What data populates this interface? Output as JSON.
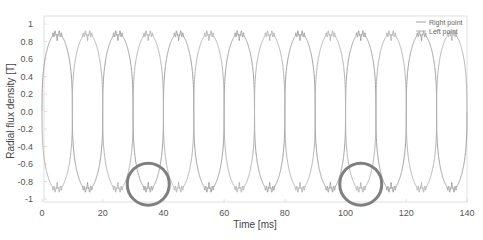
{
  "chart_data": {
    "type": "line",
    "title": "",
    "xlabel": "Time [ms]",
    "ylabel": "Radial flux density [T]",
    "xlim": [
      0,
      140
    ],
    "ylim": [
      -1.1,
      1.1
    ],
    "x_ticks": [
      0,
      20,
      40,
      60,
      80,
      100,
      120,
      140
    ],
    "x_tick_labels": [
      "0",
      "20",
      "40",
      "60",
      "80",
      "100",
      "120",
      "140"
    ],
    "y_ticks": [
      1,
      0.8,
      0.6,
      0.4,
      0.2,
      0,
      -0.2,
      -0.4,
      -0.6,
      -0.8,
      -1
    ],
    "y_tick_labels": [
      "1",
      "0.8",
      "0.6",
      "0.4",
      "0.2",
      "0.0",
      "-0.2",
      "-0.4",
      "-0.6",
      "-0.8",
      "-1"
    ],
    "grid": false,
    "legend_position": "upper right",
    "series": [
      {
        "name": "Right point",
        "color": "#a0a0a0",
        "period_ms": 20,
        "peak_value": 0.93,
        "peak_times_ms": [
          5,
          25,
          45,
          65,
          85,
          105,
          125
        ],
        "valley_value": -0.93,
        "valley_times_ms": [
          15,
          35,
          55,
          75,
          95,
          115,
          135
        ],
        "zero_crossings_ms": [
          0,
          10,
          20,
          30,
          40,
          50,
          60,
          70,
          80,
          90,
          100,
          110,
          120,
          130,
          140
        ]
      },
      {
        "name": "Left point",
        "color": "#b4b4b4",
        "period_ms": 20,
        "peak_value": 0.93,
        "peak_times_ms": [
          15,
          35,
          55,
          75,
          95,
          115,
          135
        ],
        "valley_value": -0.93,
        "valley_times_ms": [
          5,
          25,
          45,
          65,
          85,
          105,
          125
        ],
        "zero_crossings_ms": [
          0,
          10,
          20,
          30,
          40,
          50,
          60,
          70,
          80,
          90,
          100,
          110,
          120,
          130,
          140
        ]
      }
    ],
    "annotations": [
      {
        "type": "circle",
        "x_ms": 35,
        "y": -0.83,
        "note": "highlighted valley"
      },
      {
        "type": "circle",
        "x_ms": 105,
        "y": -0.83,
        "note": "highlighted valley"
      }
    ]
  },
  "legend": {
    "items": [
      {
        "label": "Right point",
        "color": "#a0a0a0"
      },
      {
        "label": "Left point",
        "color": "#b4b4b4"
      }
    ]
  },
  "style": {
    "axis_color": "#d8d8d8",
    "circle_color": "#7f7f7f"
  }
}
